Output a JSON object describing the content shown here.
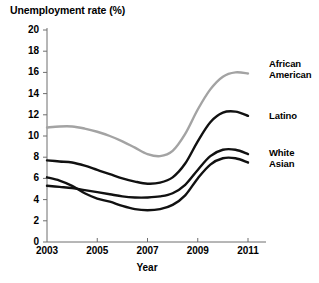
{
  "chart_data": {
    "type": "line",
    "title": "Unemployment rate (%)",
    "xlabel": "Year",
    "ylabel": "Unemployment rate (%)",
    "xlim": [
      2003,
      2011
    ],
    "ylim": [
      0,
      20
    ],
    "grid": false,
    "legend_position": "line-end-labels",
    "y_ticks": [
      "0",
      "2",
      "4",
      "6",
      "8",
      "10",
      "12",
      "14",
      "16",
      "18",
      "20"
    ],
    "y_tick_values": [
      0,
      2,
      4,
      6,
      8,
      10,
      12,
      14,
      16,
      18,
      20
    ],
    "x_ticks": [
      "2003",
      "2005",
      "2007",
      "2009",
      "2011"
    ],
    "x_tick_values": [
      2003,
      2005,
      2007,
      2009,
      2011
    ],
    "x": [
      2003,
      2003.5,
      2004,
      2004.5,
      2005,
      2005.5,
      2006,
      2006.5,
      2007,
      2007.5,
      2008,
      2008.5,
      2009,
      2009.5,
      2010,
      2010.5,
      2011
    ],
    "series": [
      {
        "name": "African American",
        "color": "#a3a3a3",
        "values": [
          10.8,
          10.9,
          10.9,
          10.7,
          10.4,
          10.0,
          9.5,
          8.9,
          8.3,
          8.1,
          8.6,
          10.2,
          12.5,
          14.4,
          15.6,
          16.0,
          15.9
        ],
        "label_text": [
          "African",
          "American"
        ]
      },
      {
        "name": "Latino",
        "color": "#111111",
        "values": [
          7.7,
          7.6,
          7.5,
          7.2,
          6.8,
          6.4,
          6.0,
          5.7,
          5.5,
          5.6,
          6.1,
          7.4,
          9.5,
          11.3,
          12.2,
          12.3,
          11.9
        ],
        "label_text": [
          "Latino"
        ]
      },
      {
        "name": "White",
        "color": "#111111",
        "values": [
          5.3,
          5.2,
          5.1,
          4.9,
          4.7,
          4.5,
          4.3,
          4.2,
          4.2,
          4.3,
          4.6,
          5.4,
          6.8,
          8.1,
          8.7,
          8.7,
          8.3
        ],
        "label_text": [
          "White"
        ]
      },
      {
        "name": "Asian",
        "color": "#111111",
        "values": [
          6.1,
          5.8,
          5.3,
          4.6,
          4.1,
          3.8,
          3.4,
          3.1,
          3.0,
          3.1,
          3.5,
          4.4,
          6.0,
          7.3,
          7.9,
          7.9,
          7.5
        ],
        "label_text": [
          "Asian"
        ]
      }
    ]
  }
}
